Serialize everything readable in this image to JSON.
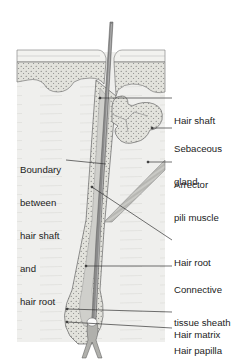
{
  "figure": {
    "type": "anatomical-diagram",
    "colors": {
      "background": "#ffffff",
      "dermis": "#eeeeec",
      "epidermis_stipple": "#dcdcd6",
      "outline": "#555555",
      "hair": "#8a8a8a",
      "leader": "#333333",
      "text": "#222222"
    }
  },
  "labels": {
    "hair_shaft": [
      "Hair shaft"
    ],
    "sebaceous_gland": [
      "Sebaceous",
      "gland"
    ],
    "boundary": [
      "Boundary",
      "between",
      "hair shaft",
      "and",
      "hair root"
    ],
    "arrector_pili": [
      "Arrector",
      "pili muscle"
    ],
    "hair_root": [
      "Hair root"
    ],
    "connective_sheath": [
      "Connective",
      "tissue sheath"
    ],
    "hair_matrix": [
      "Hair matrix"
    ],
    "hair_papilla": [
      "Hair papilla"
    ]
  }
}
